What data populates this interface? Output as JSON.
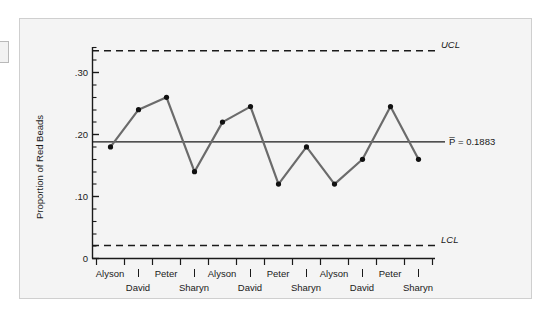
{
  "chart_data": {
    "type": "line",
    "title": "",
    "xlabel": "",
    "ylabel": "Proportion of Red Beads",
    "ylim": [
      0,
      0.36
    ],
    "yticks": [
      0,
      0.1,
      0.2,
      0.3
    ],
    "ytick_labels": [
      "0",
      ".10",
      ".20",
      ".30"
    ],
    "minor_ticks": true,
    "grid": false,
    "legend": "none",
    "categories": [
      "Alyson",
      "David",
      "Peter",
      "Sharyn",
      "Alyson",
      "David",
      "Peter",
      "Sharyn",
      "Alyson",
      "David",
      "Peter",
      "Sharyn"
    ],
    "values": [
      0.18,
      0.24,
      0.26,
      0.14,
      0.22,
      0.245,
      0.12,
      0.18,
      0.12,
      0.16,
      0.245,
      0.16
    ],
    "series": [
      {
        "name": "Proportion of Red Beads",
        "values": [
          0.18,
          0.24,
          0.26,
          0.14,
          0.22,
          0.245,
          0.12,
          0.18,
          0.12,
          0.16,
          0.245,
          0.16
        ]
      }
    ],
    "control_lines": {
      "ucl": {
        "label": "UCL",
        "value": 0.335,
        "style": "dashed"
      },
      "center": {
        "label": "P̅ = 0.1883",
        "value": 0.1883,
        "style": "solid"
      },
      "lcl": {
        "label": "LCL",
        "value": 0.021,
        "style": "dashed"
      }
    },
    "colors": {
      "line": "#6b6b6b",
      "marker": "#111111",
      "axis": "#1a1a1a",
      "panel_background": "#f4f4f4",
      "panel_border": "#cfcfcf"
    }
  },
  "axis": {
    "y_title": "Proportion of Red Beads",
    "y_tick_0": "0",
    "y_tick_10": ".10",
    "y_tick_20": ".20",
    "y_tick_30": ".30"
  },
  "x_labels": {
    "row_top": [
      "Alyson",
      "Peter",
      "Alyson",
      "Peter",
      "Alyson",
      "Peter"
    ],
    "row_bottom": [
      "David",
      "Sharyn",
      "David",
      "Sharyn",
      "David",
      "Sharyn"
    ]
  },
  "annotations": {
    "ucl": "UCL",
    "lcl": "LCL",
    "center": "P̅ = 0.1883"
  }
}
